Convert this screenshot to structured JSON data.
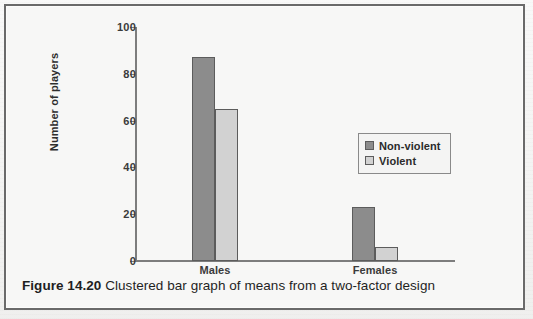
{
  "figure": {
    "caption_number": "Figure 14.20",
    "caption_text": "Clustered bar graph of means from a two-factor design"
  },
  "legend": {
    "position": "inside-right",
    "items": [
      {
        "label": "Non-violent",
        "color": "#8c8c8c",
        "icon": "legend-swatch-square"
      },
      {
        "label": "Violent",
        "color": "#d2d2d2",
        "icon": "legend-swatch-square"
      }
    ]
  },
  "background_bleed": [
    "and situated. This is contrasted to a bar graph which is the one on the other",
    "factor. the question may be addressed. One point about this graph is that you",
    "notice the number of players who simply watched a violent or non-violent in",
    "the dependent variable, rather than one of the independent variables",
    "and the number of players in each group is not of interest.",
    "comparisons than a simple table. The means can also be displayed",
    "alternatively, they can be presented in the more detailed manner in Figure",
    "these a bar graph for a two-factor experiment where the grouping variable",
    "displayed as a single bar. For each level of one factor, bars are grouped",
    "when comparing the values within each group. Inspection of the heights",
    "the two levels of a factor gives a general sense of the main effects on the",
    "Chapter 15 where we consider the analysis of variance of such designs."
  ],
  "chart_data": {
    "type": "bar",
    "title": "",
    "xlabel": "",
    "ylabel": "Number of players",
    "categories": [
      "Males",
      "Females"
    ],
    "series": [
      {
        "name": "Non-violent",
        "values": [
          87,
          23
        ],
        "color": "#8c8c8c"
      },
      {
        "name": "Violent",
        "values": [
          65,
          6
        ],
        "color": "#d2d2d2"
      }
    ],
    "ylim": [
      0,
      100
    ],
    "yticks": [
      0,
      20,
      40,
      60,
      80,
      100
    ],
    "ytick_labels": [
      "0",
      "20",
      "40",
      "60",
      "80",
      "100"
    ],
    "grid": false,
    "legend_position": "inside-right",
    "bar_border_color": "#5c5c5c"
  }
}
